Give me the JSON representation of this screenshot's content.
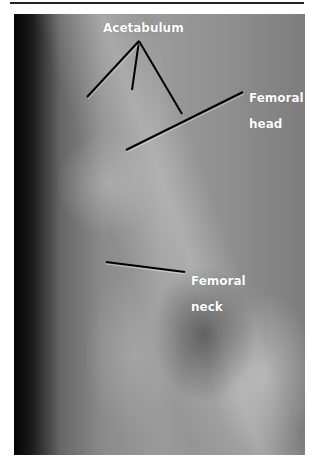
{
  "figure": {
    "type": "radiograph",
    "labels": {
      "acetabulum": "Acetabulum",
      "femoral_head_line1": "Femoral",
      "femoral_head_line2": "head",
      "femoral_neck_line1": "Femoral",
      "femoral_neck_line2": "neck"
    }
  },
  "colors": {
    "label_text": "#ffffff",
    "leader_line": "#000000",
    "frame_rule": "#222222"
  }
}
